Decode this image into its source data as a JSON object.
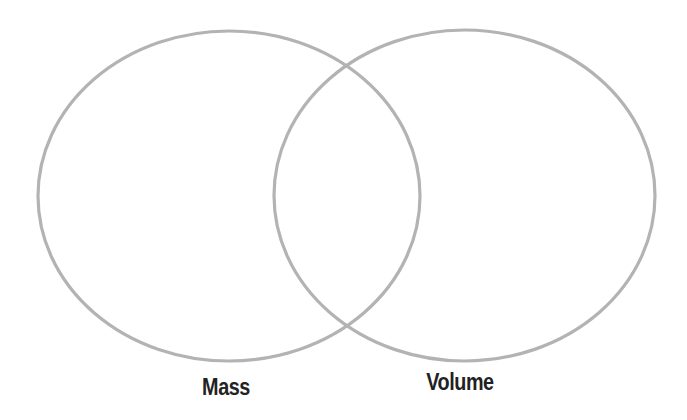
{
  "diagram": {
    "type": "venn",
    "stroke_color": "#b3b3b3",
    "label_color": "#222222",
    "sets": [
      {
        "label": "Mass",
        "cx": 229,
        "cy": 196,
        "rx": 191,
        "ry": 165,
        "label_x": 226,
        "label_y": 376
      },
      {
        "label": "Volume",
        "cx": 464.5,
        "cy": 195.5,
        "rx": 190.5,
        "ry": 165.5,
        "label_x": 460,
        "label_y": 371
      }
    ]
  }
}
